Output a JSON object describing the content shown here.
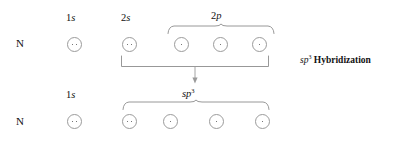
{
  "diagram": {
    "colors": {
      "text": "#111111",
      "circle_stroke": "#9b9b9b",
      "dot": "#4a4a4a",
      "bracket": "#8c8c8c",
      "background": "#ffffff"
    },
    "annotation": {
      "label_prefix": "sp",
      "label_superscript": "3",
      "label_suffix": " Hybridization",
      "full_text": "sp3 Hybridization"
    },
    "rows": [
      {
        "id": "ground-state",
        "atom": "N",
        "group_label": {
          "text_prefix": "2",
          "text_italic": "p",
          "full": "2p"
        },
        "orbitals": [
          {
            "id": "1s",
            "label_number": "1",
            "label_letter": "s",
            "label_sup": "",
            "electrons": 2
          },
          {
            "id": "2s",
            "label_number": "2",
            "label_letter": "s",
            "label_sup": "",
            "electrons": 2
          },
          {
            "id": "2p-x",
            "label_number": "",
            "label_letter": "",
            "label_sup": "",
            "electrons": 1
          },
          {
            "id": "2p-y",
            "label_number": "",
            "label_letter": "",
            "label_sup": "",
            "electrons": 1
          },
          {
            "id": "2p-z",
            "label_number": "",
            "label_letter": "",
            "label_sup": "",
            "electrons": 1
          }
        ]
      },
      {
        "id": "hybridized-state",
        "atom": "N",
        "group_label": {
          "text_prefix": "",
          "text_italic": "sp",
          "text_sup": "3",
          "full": "sp3"
        },
        "orbitals": [
          {
            "id": "1s",
            "label_number": "1",
            "label_letter": "s",
            "label_sup": "",
            "electrons": 2
          },
          {
            "id": "sp3-a",
            "label_number": "",
            "label_letter": "",
            "label_sup": "",
            "electrons": 2
          },
          {
            "id": "sp3-b",
            "label_number": "",
            "label_letter": "",
            "label_sup": "",
            "electrons": 1
          },
          {
            "id": "sp3-c",
            "label_number": "",
            "label_letter": "",
            "label_sup": "",
            "electrons": 1
          },
          {
            "id": "sp3-d",
            "label_number": "",
            "label_letter": "",
            "label_sup": "",
            "electrons": 1
          }
        ]
      }
    ]
  }
}
